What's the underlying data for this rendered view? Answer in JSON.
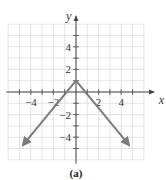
{
  "chart_data": {
    "type": "line",
    "title": "",
    "caption": "(a)",
    "xlabel": "x",
    "ylabel": "y",
    "xlim": [
      -6,
      6
    ],
    "ylim": [
      -6,
      6
    ],
    "grid": true,
    "x_ticks": [
      -4,
      -2,
      2,
      4
    ],
    "y_ticks": [
      4,
      2,
      -2,
      -4
    ],
    "x_tick_labels": [
      "−4",
      "−2",
      "2",
      "4"
    ],
    "y_tick_labels": [
      "4",
      "2",
      "−2",
      "−4"
    ],
    "function": "y = -|x| + 1",
    "series": [
      {
        "name": "f(x) = -|x| + 1",
        "points": [
          [
            -4.7,
            -3.7
          ],
          [
            0,
            1
          ],
          [
            4.7,
            -3.7
          ]
        ],
        "color": "#7a7a7a",
        "arrows": "both-ends"
      }
    ],
    "vertex": [
      0,
      1
    ]
  },
  "colors": {
    "grid": "#d8d8d8",
    "axis": "#444444",
    "curve": "#7a7a7a"
  }
}
